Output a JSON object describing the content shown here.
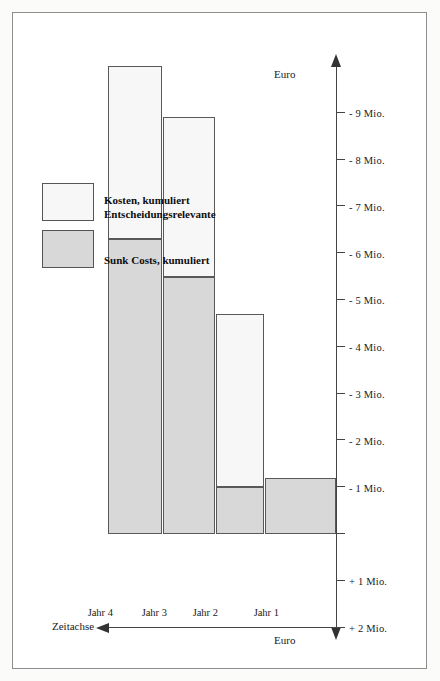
{
  "figure": {
    "orientation": "rotated-90-ccw",
    "background": "#ffffff",
    "frame_color": "#8d8d8d"
  },
  "axes": {
    "value_axis": {
      "name_left": "Euro",
      "name_right": "Euro",
      "unit": "Mio.",
      "tick_labels": [
        "+ 3 Mio.",
        "+ 2 Mio.",
        "+ 1 Mio.",
        "- 1 Mio.",
        "- 2 Mio.",
        "- 3 Mio.",
        "- 4 Mio.",
        "- 5 Mio.",
        "- 6 Mio.",
        "- 7 Mio.",
        "- 8 Mio.",
        "- 9 Mio."
      ],
      "tick_values": [
        3,
        2,
        1,
        -1,
        -2,
        -3,
        -4,
        -5,
        -6,
        -7,
        -8,
        -9
      ]
    },
    "category_axis": {
      "name": "Zeitachse",
      "labels": [
        "Jahr 1",
        "Jahr 2",
        "Jahr 3",
        "Jahr 4"
      ]
    }
  },
  "legend": {
    "entries": [
      {
        "label": "Sunk Costs, kumuliert",
        "color": "#d8d8d8"
      },
      {
        "label": "Entscheidungsrelevante\nKosten, kumuliert",
        "color": "#f7f7f7"
      }
    ],
    "items": [
      {
        "line1": "Sunk Costs, kumuliert",
        "line2": ""
      },
      {
        "line1": "Entscheidungsrelevante",
        "line2": "Kosten, kumuliert"
      }
    ]
  },
  "chart_data": {
    "type": "bar",
    "orientation": "horizontal-stacked",
    "title": "",
    "xlabel": "Euro",
    "ylabel": "Zeitachse",
    "categories": [
      "Jahr 1",
      "Jahr 2",
      "Jahr 3",
      "Jahr 4"
    ],
    "series": [
      {
        "name": "Sunk Costs, kumuliert",
        "color": "#d8d8d8",
        "values": [
          -1.2,
          -1.0,
          -5.5,
          -6.3
        ]
      },
      {
        "name": "Entscheidungsrelevante Kosten, kumuliert",
        "color": "#f7f7f7",
        "values": [
          0,
          -3.7,
          -3.4,
          -3.7
        ]
      }
    ],
    "cumulative_totals": [
      -1.2,
      -4.7,
      -8.9,
      -10.0
    ],
    "xlim": [
      3,
      -10
    ],
    "xticks": [
      3,
      2,
      1,
      0,
      -1,
      -2,
      -3,
      -4,
      -5,
      -6,
      -7,
      -8,
      -9
    ],
    "xtick_labels": [
      "+ 3 Mio.",
      "+ 2 Mio.",
      "+ 1 Mio.",
      "",
      "- 1 Mio.",
      "- 2 Mio.",
      "- 3 Mio.",
      "- 4 Mio.",
      "- 5 Mio.",
      "- 6 Mio.",
      "- 7 Mio.",
      "- 8 Mio.",
      "- 9 Mio."
    ],
    "grid": false,
    "legend_position": "top-right"
  }
}
